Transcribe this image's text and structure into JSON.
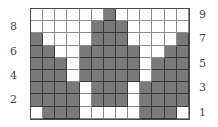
{
  "figure": {
    "columns": 13,
    "rows": 9,
    "colors": {
      "filled": "#7a7a7a",
      "empty": "#ffffff",
      "grid_line": "#3a3a3a"
    },
    "grid": [
      [
        0,
        0,
        0,
        0,
        0,
        0,
        1,
        0,
        0,
        0,
        0,
        0,
        0
      ],
      [
        0,
        0,
        0,
        0,
        0,
        1,
        1,
        1,
        0,
        0,
        0,
        0,
        0
      ],
      [
        1,
        0,
        0,
        0,
        0,
        1,
        1,
        1,
        0,
        0,
        0,
        0,
        1
      ],
      [
        1,
        1,
        0,
        0,
        1,
        1,
        1,
        1,
        1,
        0,
        0,
        1,
        1
      ],
      [
        1,
        1,
        1,
        0,
        1,
        1,
        1,
        1,
        1,
        0,
        1,
        1,
        1
      ],
      [
        1,
        1,
        1,
        0,
        1,
        1,
        1,
        1,
        1,
        0,
        1,
        1,
        1
      ],
      [
        1,
        1,
        1,
        1,
        0,
        1,
        1,
        1,
        0,
        1,
        1,
        1,
        1
      ],
      [
        1,
        1,
        1,
        1,
        0,
        1,
        1,
        1,
        0,
        1,
        1,
        1,
        1
      ],
      [
        0,
        1,
        1,
        1,
        0,
        0,
        0,
        0,
        0,
        1,
        1,
        1,
        0
      ]
    ],
    "row_labels_left": [
      {
        "text": "8",
        "row": 8
      },
      {
        "text": "6",
        "row": 6
      },
      {
        "text": "4",
        "row": 4
      },
      {
        "text": "2",
        "row": 2
      }
    ],
    "row_labels_right": [
      {
        "text": "9",
        "row": 9
      },
      {
        "text": "7",
        "row": 7
      },
      {
        "text": "5",
        "row": 5
      },
      {
        "text": "3",
        "row": 3
      },
      {
        "text": "1",
        "row": 1
      }
    ]
  }
}
